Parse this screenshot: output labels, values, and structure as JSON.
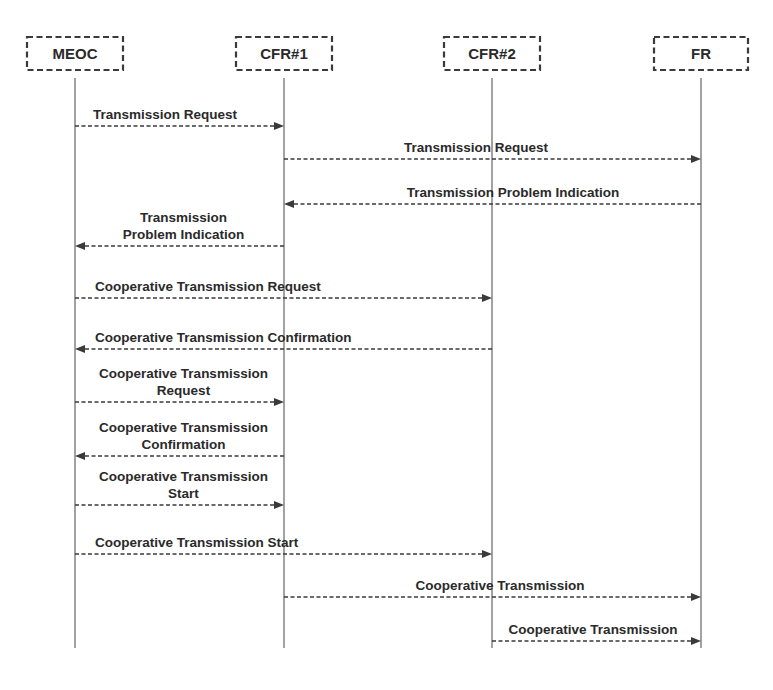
{
  "diagram": {
    "type": "sequence-diagram",
    "colors": {
      "line": "#3a3a3a",
      "text": "#2a2a2a",
      "background": "#ffffff"
    },
    "actors": [
      {
        "id": "MEOC",
        "label": "MEOC"
      },
      {
        "id": "CFR1",
        "label": "CFR#1"
      },
      {
        "id": "CFR2",
        "label": "CFR#2"
      },
      {
        "id": "FR",
        "label": "FR"
      }
    ],
    "messages": [
      {
        "from": "MEOC",
        "to": "CFR1",
        "lines": [
          "Transmission Request"
        ]
      },
      {
        "from": "CFR1",
        "to": "FR",
        "lines": [
          "Transmission Request"
        ]
      },
      {
        "from": "FR",
        "to": "CFR1",
        "lines": [
          "Transmission Problem Indication"
        ]
      },
      {
        "from": "CFR1",
        "to": "MEOC",
        "lines": [
          "Transmission",
          "Problem Indication"
        ]
      },
      {
        "from": "MEOC",
        "to": "CFR2",
        "lines": [
          "Cooperative Transmission Request"
        ]
      },
      {
        "from": "CFR2",
        "to": "MEOC",
        "lines": [
          "Cooperative Transmission Confirmation"
        ]
      },
      {
        "from": "MEOC",
        "to": "CFR1",
        "lines": [
          "Cooperative Transmission",
          "Request"
        ]
      },
      {
        "from": "CFR1",
        "to": "MEOC",
        "lines": [
          "Cooperative Transmission",
          "Confirmation"
        ]
      },
      {
        "from": "MEOC",
        "to": "CFR1",
        "lines": [
          "Cooperative Transmission",
          "Start"
        ]
      },
      {
        "from": "MEOC",
        "to": "CFR2",
        "lines": [
          "Cooperative Transmission Start"
        ]
      },
      {
        "from": "CFR1",
        "to": "FR",
        "lines": [
          "Cooperative Transmission"
        ]
      },
      {
        "from": "CFR2",
        "to": "FR",
        "lines": [
          "Cooperative Transmission"
        ]
      }
    ]
  }
}
